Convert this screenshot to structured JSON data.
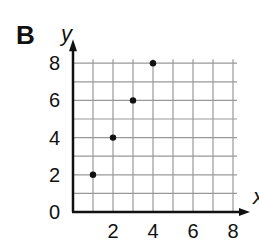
{
  "panel_label": "B",
  "chart_data": {
    "type": "scatter",
    "title": "",
    "xlabel": "x",
    "ylabel": "y",
    "x": [
      1,
      2,
      3,
      4
    ],
    "y": [
      2,
      4,
      6,
      8
    ],
    "xlim": [
      0,
      8
    ],
    "ylim": [
      0,
      8
    ],
    "xticks": [
      "2",
      "4",
      "6",
      "8"
    ],
    "yticks": [
      "0",
      "2",
      "4",
      "6",
      "8"
    ],
    "grid": true,
    "grid_step": 1,
    "legend": null
  },
  "colors": {
    "grid": "#999999",
    "axis": "#111111",
    "point": "#111111"
  }
}
